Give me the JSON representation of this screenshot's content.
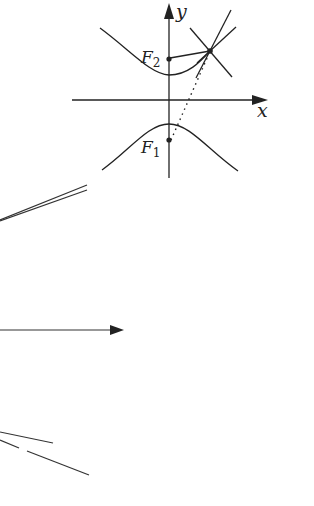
{
  "figure": {
    "type": "hyperbola-focal-property",
    "colors": {
      "stroke": "#222222",
      "background": "#ffffff"
    },
    "labels": {
      "y_axis": "y",
      "x_axis": "x",
      "focus_upper": "F",
      "focus_upper_sub": "2",
      "focus_lower": "F",
      "focus_lower_sub": "1"
    },
    "elements": [
      "x-axis-arrow",
      "y-axis-arrow",
      "upper-hyperbola-branch",
      "lower-hyperbola-branch",
      "focus-F2",
      "focus-F1",
      "point-on-hyperbola",
      "segment-F2-to-point",
      "dotted-segment-F1-to-point",
      "tangent-line",
      "normal-line"
    ],
    "partial_figure_fragments": [
      "converging-line-pair-upper-left",
      "horizontal-arrow-left",
      "line-pair-lower-left"
    ]
  }
}
